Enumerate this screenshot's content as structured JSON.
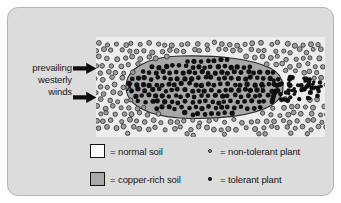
{
  "figure": {
    "panel_bg": "#dcdcdc",
    "panel_border": "#b4b4b4",
    "field_bg": "#ededed",
    "copper_soil_fill": "#a8a8a8",
    "copper_soil_outline": "#2b2b2b"
  },
  "wind": {
    "line1": "prevailing",
    "line2": "westerly",
    "line3": "winds",
    "arrow_top_name": "wind-arrow-top",
    "arrow_bottom_name": "wind-arrow-bottom",
    "arrow_color": "#0f0f0f",
    "direction": "west-to-east"
  },
  "map_labels": {
    "x": "X",
    "y": "Y"
  },
  "legend": {
    "soil": [
      {
        "swatch": "normal-soil-swatch",
        "color": "#fbfbfb",
        "label": "= normal soil"
      },
      {
        "swatch": "copper-rich-soil-swatch",
        "color": "#a8a8a8",
        "label": "= copper-rich soil"
      }
    ],
    "plants": [
      {
        "marker": "non-tolerant-plant-dot",
        "style": "open-gray-circle",
        "label": "= non-tolerant plant"
      },
      {
        "marker": "tolerant-plant-dot",
        "style": "solid-black-circle",
        "label": "= tolerant plant"
      }
    ]
  },
  "chart_data": {
    "type": "scatter",
    "xlabel": "",
    "ylabel": "",
    "grid": false,
    "legend_position": "bottom",
    "annotations": [
      "X",
      "Y",
      "prevailing westerly winds"
    ],
    "series": [
      {
        "name": "non-tolerant plant",
        "marker": "open-gray-circle",
        "region": "normal soil surrounding the copper-rich patch",
        "approx_count": 430
      },
      {
        "name": "tolerant plant",
        "marker": "solid-black-circle",
        "region": "copper-rich soil ellipse and downwind plume east of point Y",
        "approx_count": 320
      }
    ],
    "regions": [
      {
        "name": "normal soil",
        "fill": "#ededed"
      },
      {
        "name": "copper-rich soil",
        "fill": "#a8a8a8",
        "shape": "ellipse",
        "cx": 0.42,
        "cy": 0.5,
        "rx": 0.33,
        "ry": 0.33
      }
    ]
  }
}
